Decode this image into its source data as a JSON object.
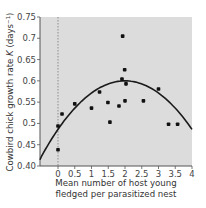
{
  "chart_data": {
    "type": "scatter",
    "title": "",
    "xlabel_lines": [
      "Mean number of host young",
      "fledged per parasitized nest"
    ],
    "ylabel": "Cowbird chick growth rate",
    "ylabel_symbol": "K",
    "ylabel_unit": "(days⁻¹)",
    "xlim": [
      -0.55,
      4
    ],
    "ylim": [
      0.4,
      0.75
    ],
    "x_ticks": [
      0,
      0.5,
      1,
      1.5,
      2,
      2.5,
      3,
      3.5,
      4
    ],
    "x_tick_labels": [
      "0",
      "0.5",
      "1",
      "1.5",
      "2",
      "2.5",
      "3",
      "3.5",
      "4"
    ],
    "y_ticks": [
      0.4,
      0.45,
      0.5,
      0.55,
      0.6,
      0.65,
      0.7,
      0.75
    ],
    "y_tick_labels": [
      "0.40",
      "0.45",
      "0.5",
      "0.55",
      "0.6",
      "0.65",
      "0.7",
      "0.75"
    ],
    "grid": false,
    "reference_line_x": 0,
    "points": [
      {
        "x": 0.0,
        "y": 0.494
      },
      {
        "x": 0.0,
        "y": 0.438
      },
      {
        "x": 0.12,
        "y": 0.522
      },
      {
        "x": 0.5,
        "y": 0.546
      },
      {
        "x": 1.0,
        "y": 0.536
      },
      {
        "x": 1.24,
        "y": 0.574
      },
      {
        "x": 1.49,
        "y": 0.549
      },
      {
        "x": 1.55,
        "y": 0.503
      },
      {
        "x": 1.82,
        "y": 0.541
      },
      {
        "x": 1.91,
        "y": 0.604
      },
      {
        "x": 1.93,
        "y": 0.705
      },
      {
        "x": 1.99,
        "y": 0.626
      },
      {
        "x": 2.0,
        "y": 0.553
      },
      {
        "x": 2.03,
        "y": 0.593
      },
      {
        "x": 2.55,
        "y": 0.553
      },
      {
        "x": 3.0,
        "y": 0.581
      },
      {
        "x": 3.3,
        "y": 0.498
      },
      {
        "x": 3.57,
        "y": 0.498
      }
    ],
    "fit_curve": {
      "type": "quadratic",
      "description": "y = 0.60 - 0.0285*(x - 2)^2",
      "vertex": {
        "x": 2.0,
        "y": 0.6
      },
      "a": -0.0285
    }
  },
  "colors": {
    "plot_bg": "#dcdcdc",
    "point": "#111111",
    "curve": "#1a1a1a",
    "axis": "#555555",
    "reference_line": "#777777"
  }
}
